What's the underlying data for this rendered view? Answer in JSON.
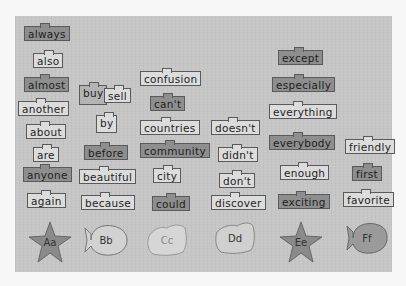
{
  "word_wall": {
    "columns": [
      {
        "letter": "Aa",
        "words": [
          "always",
          "also",
          "almost",
          "another",
          "about",
          "are",
          "anyone",
          "again"
        ]
      },
      {
        "letter": "Bb",
        "words": [
          "buy",
          "sell",
          "by",
          "before",
          "beautiful",
          "because"
        ]
      },
      {
        "letter": "Cc",
        "words": [
          "confusion",
          "can't",
          "countries",
          "community",
          "city",
          "could"
        ]
      },
      {
        "letter": "Dd",
        "words": [
          "doesn't",
          "didn't",
          "don't",
          "discover"
        ]
      },
      {
        "letter": "Ee",
        "words": [
          "except",
          "especially",
          "everything",
          "everybody",
          "enough",
          "exciting"
        ]
      },
      {
        "letter": "Ff",
        "words": [
          "friendly",
          "first",
          "favorite"
        ]
      }
    ]
  },
  "colors": {
    "page_bg": "#f7f7f7",
    "board_bg": "#c6c6c6",
    "card_light": "#dcdcdc",
    "card_dark": "#8e8e8e",
    "card_border": "#5a5a5a"
  }
}
